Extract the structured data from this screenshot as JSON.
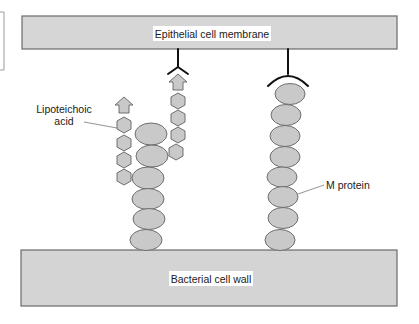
{
  "diagram": {
    "top_bar": {
      "label": "Epithelial cell membrane",
      "fill": "#d6d6d6",
      "stroke": "#6a6a6a"
    },
    "bottom_bar": {
      "label": "Bacterial cell wall",
      "fill": "#d4d4d4",
      "stroke": "#6a6a6a"
    },
    "labels": {
      "lipoteichoic_line1": "Lipoteichoic",
      "lipoteichoic_line2": "acid",
      "m_protein": "M protein"
    },
    "colors": {
      "shape_fill": "#c9c9c9",
      "shape_stroke": "#6e6e6e",
      "receptor_stroke": "#111111",
      "leader_line": "#777777"
    },
    "components": {
      "lta_chains": 2,
      "lta_left_hexagons": 4,
      "lta_right_hexagons": 4,
      "left_protein_ellipses": 6,
      "m_protein_ellipses": 8,
      "receptors": [
        "Y-shaped receptor bound to lipoteichoic acid",
        "arc-shaped receptor bound to M protein"
      ]
    }
  }
}
